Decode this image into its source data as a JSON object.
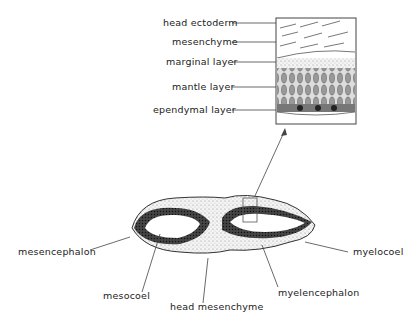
{
  "inset": {
    "labels": [
      {
        "text": "head ectoderm"
      },
      {
        "text": "mesenchyme"
      },
      {
        "text": "marginal layer"
      },
      {
        "text": "mantle layer"
      },
      {
        "text": "ependymal layer"
      }
    ]
  },
  "section": {
    "labels": {
      "mesencephalon": "mesencephalon",
      "mesocoel": "mesocoel",
      "head_mesenchyme": "head mesenchyme",
      "myelocoel": "myelocoel",
      "myelencephalon": "myelencephalon"
    }
  }
}
